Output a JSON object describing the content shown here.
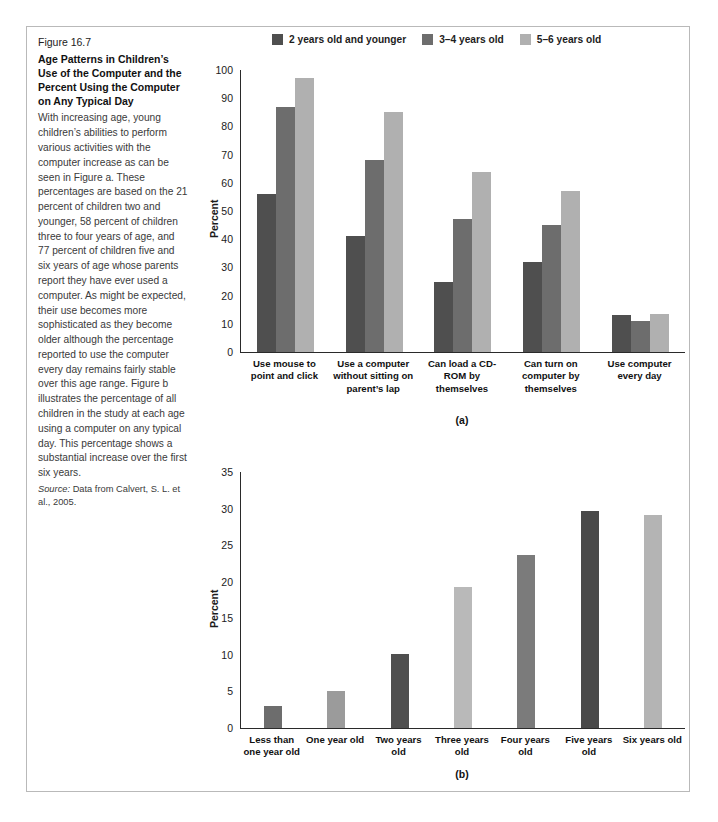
{
  "figure": {
    "number": "Figure 16.7",
    "title": "Age Patterns in Children’s Use of the Computer and the Percent Using the Computer on Any Typical Day",
    "body": "With increasing age, young children’s abilities to perform various activities with the computer increase as can be seen in Figure a. These percentages are based on the 21 percent of children two and younger, 58 percent of children three to four years of age, and 77 percent of children five and six years of age whose parents report they have ever used a computer. As might be expected, their use becomes more sophisticated as they become older although the percentage reported to use the computer every day remains fairly stable over this age range. Figure b illustrates the percentage of all children in the study at each age using a computer on any typical day. This percentage shows a substantial increase over the first six years.",
    "source_label": "Source:",
    "source_text": " Data from Calvert, S. L. et al., 2005."
  },
  "legend": {
    "items": [
      {
        "label": "2 years old and younger",
        "color": "#4f4f4f"
      },
      {
        "label": "3–4 years old",
        "color": "#6d6d6d"
      },
      {
        "label": "5–6 years old",
        "color": "#b0b0b0"
      }
    ]
  },
  "colors": {
    "series_1": "#4f4f4f",
    "series_2": "#6d6d6d",
    "series_3": "#b0b0b0",
    "axis": "#2a2a2a",
    "frame": "#b9b9b9"
  },
  "chart_data": [
    {
      "id": "a",
      "panel_label": "(a)",
      "type": "bar",
      "title": "",
      "xlabel": "",
      "ylabel": "Percent",
      "ylim": [
        0,
        100
      ],
      "yticks": [
        0,
        10,
        20,
        30,
        40,
        50,
        60,
        70,
        80,
        90,
        100
      ],
      "grid": false,
      "legend_position": "top",
      "categories": [
        "Use mouse to point and click",
        "Use a computer without sitting on parent’s lap",
        "Can load a CD-ROM by themselves",
        "Can turn on computer by themselves",
        "Use computer every day"
      ],
      "series": [
        {
          "name": "2 years old and younger",
          "color": "#4f4f4f",
          "values": [
            56,
            41,
            25,
            32,
            13
          ]
        },
        {
          "name": "3–4 years old",
          "color": "#6d6d6d",
          "values": [
            87,
            68,
            47,
            45,
            11
          ]
        },
        {
          "name": "5–6 years old",
          "color": "#b0b0b0",
          "values": [
            97,
            85,
            64,
            57,
            13.5
          ]
        }
      ]
    },
    {
      "id": "b",
      "panel_label": "(b)",
      "type": "bar",
      "title": "",
      "xlabel": "",
      "ylabel": "Percent",
      "ylim": [
        0,
        35
      ],
      "yticks": [
        0,
        5,
        10,
        15,
        20,
        25,
        30,
        35
      ],
      "grid": false,
      "legend_position": "none",
      "categories": [
        "Less than one year old",
        "One year old",
        "Two years old",
        "Three years old",
        "Four years old",
        "Five years old",
        "Six years old"
      ],
      "values": [
        3,
        5,
        10.1,
        19.3,
        23.7,
        29.7,
        29.1
      ],
      "bar_colors": [
        "#6d6d6d",
        "#9b9b9b",
        "#4f4f4f",
        "#b9b9b9",
        "#7b7b7b",
        "#4a4a4a",
        "#b4b4b4"
      ]
    }
  ]
}
